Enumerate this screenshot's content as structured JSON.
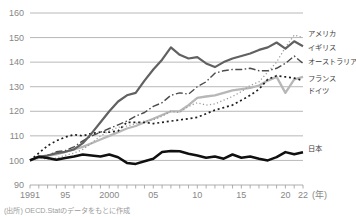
{
  "chart_data": {
    "type": "line",
    "title": "",
    "x_start": 1991,
    "x_end": 2022,
    "ylim": [
      90,
      160
    ],
    "y_ticks": [
      90,
      100,
      110,
      120,
      130,
      140,
      150,
      160
    ],
    "x_ticks": [
      {
        "label": "1991",
        "year": 1991
      },
      {
        "label": "95",
        "year": 1995
      },
      {
        "label": "2000",
        "year": 2000
      },
      {
        "label": "05",
        "year": 2005
      },
      {
        "label": "10",
        "year": 2010
      },
      {
        "label": "15",
        "year": 2015
      },
      {
        "label": "20",
        "year": 2020
      },
      {
        "label": "22",
        "year": 2022
      }
    ],
    "x_unit_label": "(年)",
    "grid": true,
    "legend_position": "right-of-line-ends",
    "draw_order": [
      3,
      4,
      0,
      2,
      1,
      5
    ],
    "series": [
      {
        "id": "usa",
        "name": "アメリカ",
        "style": "dotted-fine",
        "color": "#9b9b9b",
        "width": 1.3,
        "label_y": 33,
        "values": [
          100,
          101,
          100.5,
          101,
          102,
          103,
          104.5,
          107,
          110,
          112,
          113.5,
          114,
          115,
          116,
          116.5,
          118,
          120,
          119.5,
          122,
          123.5,
          122.5,
          123,
          124.5,
          126,
          128,
          130.5,
          132,
          136,
          140,
          146,
          151,
          150
        ]
      },
      {
        "id": "uk",
        "name": "イギリス",
        "style": "solid",
        "color": "#616161",
        "width": 2.2,
        "label_y": 47,
        "values": [
          100,
          101.5,
          102,
          103,
          103.5,
          104.5,
          107,
          111,
          115.5,
          120,
          124,
          126.5,
          127.5,
          132.5,
          137,
          141,
          146,
          143,
          141.5,
          142,
          139.5,
          138,
          140,
          141.5,
          142.5,
          143.5,
          145,
          146,
          148,
          145.5,
          148.5,
          146.5
        ]
      },
      {
        "id": "australia",
        "name": "オーストラリア",
        "style": "dashdot",
        "color": "#4b4b4b",
        "width": 1.4,
        "label_y": 61,
        "values": [
          100,
          101.5,
          102,
          103.5,
          104,
          105.5,
          108,
          110,
          111.5,
          113,
          114.5,
          116,
          118,
          119.5,
          122,
          123.5,
          126.5,
          127.5,
          127,
          130,
          132,
          135.5,
          136.5,
          137,
          137,
          137.5,
          136.5,
          136.5,
          137.5,
          139.5,
          142.5,
          139.5
        ]
      },
      {
        "id": "france",
        "name": "フランス",
        "style": "solid",
        "color": "#b7b7b7",
        "width": 2.3,
        "label_y": 78,
        "values": [
          100,
          101,
          102,
          102.5,
          103.5,
          104.5,
          105.5,
          107,
          108.5,
          110,
          111.5,
          113,
          114,
          115.5,
          117,
          118.5,
          120,
          120,
          122.5,
          125.5,
          126,
          126.5,
          127.5,
          128.5,
          129,
          129.5,
          130.5,
          132.5,
          134,
          127.5,
          133,
          134
        ]
      },
      {
        "id": "germany",
        "name": "ドイツ",
        "style": "dotted-coarse",
        "color": "#1e1e1e",
        "width": 1.7,
        "label_y": 90,
        "values": [
          100,
          103,
          106,
          108,
          109.5,
          110.5,
          110,
          111,
          111.5,
          111.5,
          112,
          115.5,
          115.5,
          115.5,
          115,
          115.5,
          116,
          116.5,
          117,
          117.5,
          119,
          120.5,
          121.5,
          122.5,
          124.5,
          126.5,
          129,
          133,
          134.5,
          134,
          133.5,
          132.5
        ]
      },
      {
        "id": "japan",
        "name": "日本",
        "style": "solid",
        "color": "#101010",
        "width": 2.5,
        "label_y": 148,
        "values": [
          100,
          101.5,
          101,
          100.3,
          101,
          101.6,
          102.4,
          102,
          101.6,
          102.4,
          101.3,
          99,
          98.6,
          99.7,
          100.7,
          103.4,
          103.8,
          103.7,
          102.7,
          102,
          101.1,
          101.6,
          100.7,
          102.4,
          101.1,
          101.6,
          100.7,
          100,
          101.3,
          103.4,
          102.5,
          103.3
        ]
      }
    ],
    "source_note": "(出所) OECD.Statのデータをもとに作成"
  },
  "colors": {
    "background": "#ffffff",
    "grid": "#a6a6a6",
    "axis_tick": "#9a9a9a",
    "axis_text": "#878787",
    "legend_text": "#3d3d3d",
    "note_text": "#9b9b9b"
  }
}
